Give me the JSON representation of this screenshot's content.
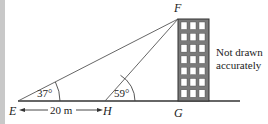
{
  "diagram": {
    "points": {
      "E": {
        "label": "E",
        "x": 18,
        "y": 101
      },
      "H": {
        "label": "H",
        "x": 105,
        "y": 101
      },
      "G": {
        "label": "G",
        "x": 178,
        "y": 101
      },
      "F": {
        "label": "F",
        "x": 178,
        "y": 19
      }
    },
    "angles": {
      "E": "37°",
      "H": "59°"
    },
    "distance_EH": "20 m",
    "note_line1": "Not drawn",
    "note_line2": "accurately",
    "building": {
      "columns": 3,
      "rows": 7
    },
    "colors": {
      "line": "#333333",
      "building_fill": "#7a7a7a",
      "window_fill": "#ffffff",
      "strip": "#c8c8c8"
    }
  }
}
